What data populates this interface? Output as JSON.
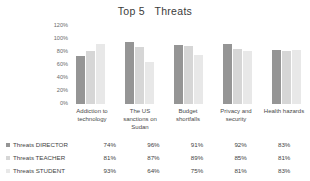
{
  "chart_data": {
    "type": "bar",
    "title": "Top 5   Threats",
    "xlabel": "",
    "ylabel": "",
    "ylim": [
      0,
      120
    ],
    "grid": false,
    "legend_position": "bottom-table",
    "categories": [
      "Addiction to technology",
      "The US sanctions on Sudan",
      "Budget shortfalls",
      "Privacy and security",
      "Health hazards"
    ],
    "ytick_labels": [
      "120%",
      "100%",
      "80%",
      "60%",
      "40%",
      "20%",
      "0%"
    ],
    "ytick_values": [
      120,
      100,
      80,
      60,
      40,
      20,
      0
    ],
    "series": [
      {
        "name": "Threats DIRECTOR",
        "color": "#959595",
        "values": [
          74,
          96,
          91,
          92,
          83
        ],
        "labels": [
          "74%",
          "96%",
          "91%",
          "92%",
          "83%"
        ]
      },
      {
        "name": "Threats TEACHER",
        "color": "#d6d6d6",
        "values": [
          81,
          87,
          89,
          85,
          81
        ],
        "labels": [
          "81%",
          "87%",
          "89%",
          "85%",
          "81%"
        ]
      },
      {
        "name": "Threats STUDENT",
        "color": "#e8e8e8",
        "values": [
          93,
          64,
          75,
          81,
          83
        ],
        "labels": [
          "93%",
          "64%",
          "75%",
          "81%",
          "83%"
        ]
      }
    ]
  }
}
